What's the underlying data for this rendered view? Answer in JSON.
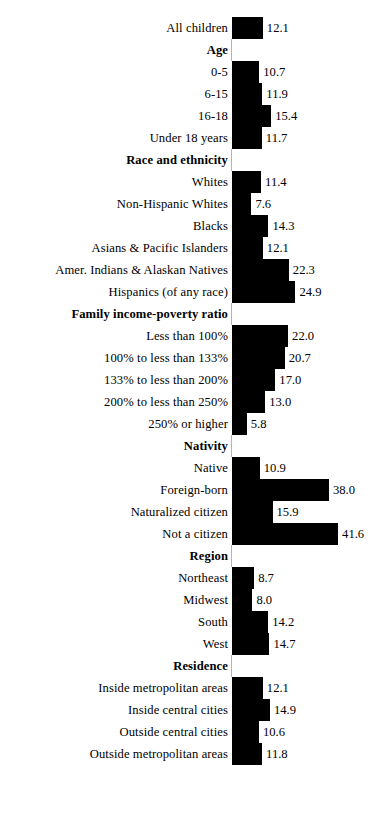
{
  "chart_data": {
    "type": "bar",
    "orientation": "horizontal",
    "title": "",
    "subtitle": "",
    "xlabel": "",
    "ylabel": "",
    "xlim": [
      0,
      42
    ],
    "grid": false,
    "legend": null,
    "bar_color": "#000000",
    "axis_color": "#b4b4b4",
    "value_label_format": "one-decimal",
    "rows": [
      {
        "label": "All children",
        "value": 12.1,
        "value_text": "12.1",
        "type": "bar"
      },
      {
        "label": "Age",
        "value": null,
        "value_text": "",
        "type": "header"
      },
      {
        "label": "0-5",
        "value": 10.7,
        "value_text": "10.7",
        "type": "bar"
      },
      {
        "label": "6-15",
        "value": 11.9,
        "value_text": "11.9",
        "type": "bar"
      },
      {
        "label": "16-18",
        "value": 15.4,
        "value_text": "15.4",
        "type": "bar"
      },
      {
        "label": "Under 18 years",
        "value": 11.7,
        "value_text": "11.7",
        "type": "bar"
      },
      {
        "label": "Race and ethnicity",
        "value": null,
        "value_text": "",
        "type": "header"
      },
      {
        "label": "Whites",
        "value": 11.4,
        "value_text": "11.4",
        "type": "bar"
      },
      {
        "label": "Non-Hispanic Whites",
        "value": 7.6,
        "value_text": "7.6",
        "type": "bar"
      },
      {
        "label": "Blacks",
        "value": 14.3,
        "value_text": "14.3",
        "type": "bar"
      },
      {
        "label": "Asians & Pacific Islanders",
        "value": 12.1,
        "value_text": "12.1",
        "type": "bar"
      },
      {
        "label": "Amer. Indians & Alaskan Natives",
        "value": 22.3,
        "value_text": "22.3",
        "type": "bar"
      },
      {
        "label": "Hispanics (of any race)",
        "value": 24.9,
        "value_text": "24.9",
        "type": "bar"
      },
      {
        "label": "Family income-poverty ratio",
        "value": null,
        "value_text": "",
        "type": "header"
      },
      {
        "label": "Less than 100%",
        "value": 22.0,
        "value_text": "22.0",
        "type": "bar"
      },
      {
        "label": "100% to less than 133%",
        "value": 20.7,
        "value_text": "20.7",
        "type": "bar"
      },
      {
        "label": "133% to less than 200%",
        "value": 17.0,
        "value_text": "17.0",
        "type": "bar"
      },
      {
        "label": "200% to less than 250%",
        "value": 13.0,
        "value_text": "13.0",
        "type": "bar"
      },
      {
        "label": "250% or higher",
        "value": 5.8,
        "value_text": "5.8",
        "type": "bar"
      },
      {
        "label": "Nativity",
        "value": null,
        "value_text": "",
        "type": "header"
      },
      {
        "label": "Native",
        "value": 10.9,
        "value_text": "10.9",
        "type": "bar"
      },
      {
        "label": "Foreign-born",
        "value": 38.0,
        "value_text": "38.0",
        "type": "bar"
      },
      {
        "label": "Naturalized citizen",
        "value": 15.9,
        "value_text": "15.9",
        "type": "bar"
      },
      {
        "label": "Not a citizen",
        "value": 41.6,
        "value_text": "41.6",
        "type": "bar"
      },
      {
        "label": "Region",
        "value": null,
        "value_text": "",
        "type": "header"
      },
      {
        "label": "Northeast",
        "value": 8.7,
        "value_text": "8.7",
        "type": "bar"
      },
      {
        "label": "Midwest",
        "value": 8.0,
        "value_text": "8.0",
        "type": "bar"
      },
      {
        "label": "South",
        "value": 14.2,
        "value_text": "14.2",
        "type": "bar"
      },
      {
        "label": "West",
        "value": 14.7,
        "value_text": "14.7",
        "type": "bar"
      },
      {
        "label": "Residence",
        "value": null,
        "value_text": "",
        "type": "header"
      },
      {
        "label": "Inside metropolitan areas",
        "value": 12.1,
        "value_text": "12.1",
        "type": "bar"
      },
      {
        "label": "Inside central cities",
        "value": 14.9,
        "value_text": "14.9",
        "type": "bar"
      },
      {
        "label": "Outside central cities",
        "value": 10.6,
        "value_text": "10.6",
        "type": "bar"
      },
      {
        "label": "Outside metropolitan areas",
        "value": 11.8,
        "value_text": "11.8",
        "type": "bar"
      }
    ]
  },
  "layout": {
    "row_height": 22,
    "top_offset": 17,
    "axis_x": 232,
    "px_per_unit": 2.55,
    "label_right_edge": 228,
    "value_gap": 4
  }
}
